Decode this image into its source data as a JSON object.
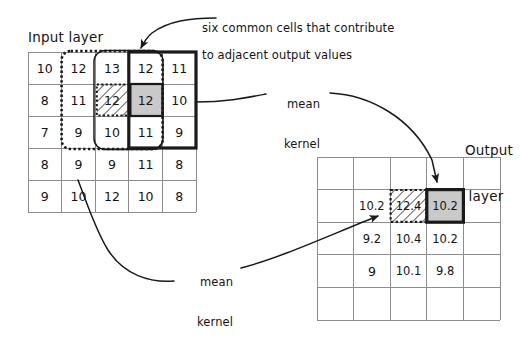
{
  "diagram": {
    "input_title": "Input layer",
    "output_title_line1": "Output",
    "output_title_line2": "layer",
    "caption_line1": "six common cells that contribute",
    "caption_line2": "to adjacent output values",
    "mean_kernel_top_line1": "mean",
    "mean_kernel_top_line2": "kernel",
    "mean_kernel_bottom_line1": "mean",
    "mean_kernel_bottom_line2": "kernel"
  },
  "chart_data": {
    "type": "table",
    "input_grid": {
      "label": "Input layer",
      "rows": 5,
      "cols": 5,
      "values": [
        [
          "10",
          "12",
          "13",
          "12",
          "11"
        ],
        [
          "8",
          "11",
          "12",
          "12",
          "10"
        ],
        [
          "7",
          "9",
          "10",
          "11",
          "9"
        ],
        [
          "8",
          "9",
          "9",
          "11",
          "8"
        ],
        [
          "9",
          "10",
          "12",
          "10",
          "8"
        ]
      ],
      "highlighted_cells": [
        {
          "row": 1,
          "col": 2,
          "value": "12",
          "style": "hatched"
        },
        {
          "row": 1,
          "col": 3,
          "value": "12",
          "style": "gray"
        }
      ],
      "overlays": [
        {
          "name": "dotted-kernel-region",
          "style": "dotted",
          "rows": [
            0,
            2
          ],
          "cols": [
            1,
            3
          ]
        },
        {
          "name": "solid-kernel-region",
          "style": "solid-rounded",
          "rows": [
            0,
            2
          ],
          "cols": [
            2,
            3
          ]
        },
        {
          "name": "bold-kernel-region",
          "style": "bold",
          "rows": [
            0,
            2
          ],
          "cols": [
            3,
            4
          ]
        }
      ]
    },
    "output_grid": {
      "label": "Output layer",
      "rows": 5,
      "cols": 5,
      "values": [
        [
          "",
          "",
          "",
          "",
          ""
        ],
        [
          "",
          "10.2",
          "12.4",
          "10.2",
          ""
        ],
        [
          "",
          "9.2",
          "10.4",
          "10.2",
          ""
        ],
        [
          "",
          "9",
          "10.1",
          "9.8",
          ""
        ],
        [
          "",
          "",
          "",
          "",
          ""
        ]
      ],
      "highlighted_cells": [
        {
          "row": 1,
          "col": 2,
          "value": "12.4",
          "style": "hatched"
        },
        {
          "row": 1,
          "col": 3,
          "value": "10.2",
          "style": "gray"
        }
      ]
    },
    "annotations": [
      {
        "text": "six common cells that contribute to adjacent output values",
        "points_to": "dotted-kernel-region"
      },
      {
        "text": "mean kernel",
        "points_to": "input bold region and output gray cell"
      },
      {
        "text": "mean kernel",
        "points_to": "input dotted region and output hatched cell"
      }
    ],
    "colors": {
      "grid_line": "#8d8d8d",
      "bold_outline": "#1a1a1a",
      "gray_fill": "#c9c9c9",
      "hatch_stroke": "#3a3a3a",
      "text": "#141414"
    }
  }
}
